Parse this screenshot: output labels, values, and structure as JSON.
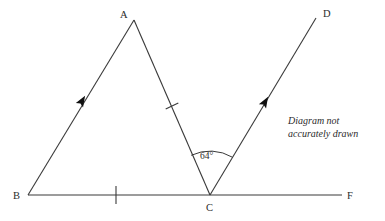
{
  "diagram": {
    "note": {
      "line1": "Diagram not",
      "line2": "accurately drawn"
    },
    "stroke_color": "#3a3a3a",
    "arrow_color": "#101010",
    "background_color": "#ffffff",
    "points": {
      "A": {
        "label": "A",
        "x": 134,
        "y": 20,
        "label_x": 120,
        "label_y": 18
      },
      "B": {
        "label": "B",
        "x": 28,
        "y": 195,
        "label_x": 13,
        "label_y": 199
      },
      "C": {
        "label": "C",
        "x": 210,
        "y": 195,
        "label_x": 206,
        "label_y": 210
      },
      "D": {
        "label": "D",
        "x": 316,
        "y": 18,
        "label_x": 323,
        "label_y": 17
      },
      "F": {
        "label": "F",
        "x": 342,
        "y": 195,
        "label_x": 347,
        "label_y": 199
      }
    },
    "segments": [
      {
        "name": "segment-BA",
        "from": "B",
        "to": "A"
      },
      {
        "name": "segment-AC",
        "from": "A",
        "to": "C"
      },
      {
        "name": "segment-BF",
        "from": "B",
        "to": "F"
      },
      {
        "name": "ray-CD",
        "from": "C",
        "to": "D"
      }
    ],
    "arrows": [
      {
        "name": "arrow-on-BA",
        "x": 82,
        "y": 101,
        "angle_deg": -58.9
      },
      {
        "name": "arrow-on-CD",
        "x": 265,
        "y": 102,
        "angle_deg": -59.1
      }
    ],
    "tick_marks": [
      {
        "name": "tick-on-AC",
        "x": 172,
        "y": 106,
        "angle_deg": 64
      },
      {
        "name": "tick-on-BC",
        "x": 116,
        "y": 195,
        "angle_deg": 0
      }
    ],
    "angle": {
      "name": "angle-ACD",
      "value": "64°",
      "vertex": "C",
      "label_x": 200,
      "label_y": 159,
      "arc_radius": 44
    }
  }
}
